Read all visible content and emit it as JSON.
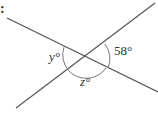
{
  "diagram": {
    "type": "intersecting-lines-angles",
    "labels": {
      "y": "y°",
      "z": "z°",
      "known": "58°"
    },
    "marker": ":",
    "line_color": "#555555"
  }
}
